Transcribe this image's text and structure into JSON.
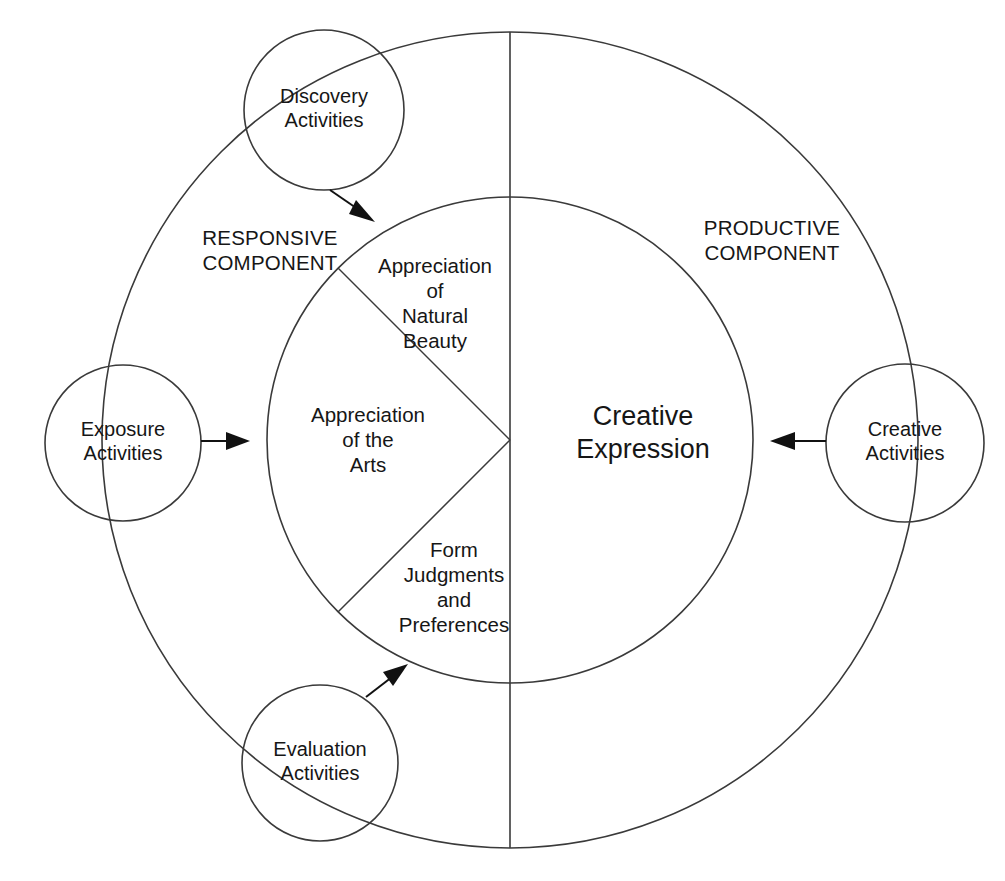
{
  "figure": {
    "title_partial": "",
    "background_color": "#ffffff",
    "line_color": "#3a3a3a",
    "text_color": "#161616"
  },
  "components": {
    "left": {
      "name": "responsive-component",
      "label": "RESPONSIVE\nCOMPONENT"
    },
    "right": {
      "name": "productive-component",
      "label": "PRODUCTIVE\nCOMPONENT"
    }
  },
  "center": {
    "label": "Creative\nExpression"
  },
  "wedges": [
    {
      "id": "appreciation-natural-beauty",
      "label": "Appreciation\nof\nNatural\nBeauty"
    },
    {
      "id": "appreciation-arts",
      "label": "Appreciation\nof the\nArts"
    },
    {
      "id": "form-judgments-preferences",
      "label": "Form\nJudgments\nand\nPreferences"
    }
  ],
  "activity_nodes": [
    {
      "id": "discovery-activities",
      "label": "Discovery\nActivities",
      "position": "top-left"
    },
    {
      "id": "exposure-activities",
      "label": "Exposure\nActivities",
      "position": "left"
    },
    {
      "id": "evaluation-activities",
      "label": "Evaluation\nActivities",
      "position": "bottom-left"
    },
    {
      "id": "creative-activities",
      "label": "Creative\nActivities",
      "position": "right"
    }
  ],
  "arrows": [
    {
      "id": "discovery-to-inner",
      "direction": "down-right"
    },
    {
      "id": "exposure-to-inner",
      "direction": "right"
    },
    {
      "id": "evaluation-to-inner",
      "direction": "up-right"
    },
    {
      "id": "creative-to-inner",
      "direction": "left"
    }
  ]
}
